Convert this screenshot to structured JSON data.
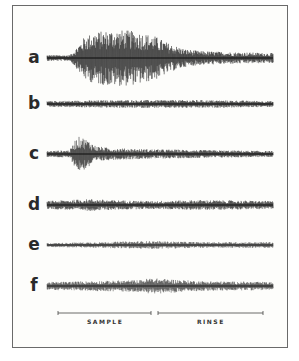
{
  "figure": {
    "rows": [
      {
        "label": "a",
        "center_y": 58,
        "envelope": [
          [
            47,
            3
          ],
          [
            70,
            3
          ],
          [
            76,
            10
          ],
          [
            85,
            22
          ],
          [
            95,
            26
          ],
          [
            110,
            28
          ],
          [
            125,
            28
          ],
          [
            140,
            26
          ],
          [
            155,
            22
          ],
          [
            170,
            14
          ],
          [
            185,
            9
          ],
          [
            200,
            7
          ],
          [
            230,
            6
          ],
          [
            273,
            5
          ]
        ],
        "ink": 0.95
      },
      {
        "label": "b",
        "center_y": 104,
        "envelope": [
          [
            47,
            3
          ],
          [
            120,
            4
          ],
          [
            200,
            4
          ],
          [
            273,
            3
          ]
        ],
        "ink": 0.9
      },
      {
        "label": "c",
        "center_y": 154,
        "envelope": [
          [
            47,
            3
          ],
          [
            70,
            4
          ],
          [
            75,
            14
          ],
          [
            80,
            18
          ],
          [
            88,
            14
          ],
          [
            96,
            8
          ],
          [
            110,
            6
          ],
          [
            140,
            5
          ],
          [
            200,
            4
          ],
          [
            273,
            3
          ]
        ],
        "ink": 0.9
      },
      {
        "label": "d",
        "center_y": 205,
        "envelope": [
          [
            47,
            4
          ],
          [
            90,
            6
          ],
          [
            110,
            5
          ],
          [
            150,
            4
          ],
          [
            200,
            5
          ],
          [
            273,
            4
          ]
        ],
        "ink": 0.9
      },
      {
        "label": "e",
        "center_y": 245,
        "envelope": [
          [
            47,
            2
          ],
          [
            100,
            3
          ],
          [
            150,
            4
          ],
          [
            200,
            3
          ],
          [
            273,
            3
          ]
        ],
        "ink": 0.7
      },
      {
        "label": "f",
        "center_y": 286,
        "envelope": [
          [
            47,
            4
          ],
          [
            140,
            6
          ],
          [
            150,
            8
          ],
          [
            200,
            5
          ],
          [
            273,
            4
          ]
        ],
        "ink": 0.75
      }
    ],
    "scale_bars": [
      {
        "label": "SAMPLE",
        "x1": 58,
        "x2": 151,
        "y": 313,
        "label_x": 87
      },
      {
        "label": "RINSE",
        "x1": 158,
        "x2": 263,
        "y": 313,
        "label_x": 197
      }
    ],
    "colors": {
      "ink": "#1a1a1a",
      "frame": "#6a6a6a",
      "paper": "#fdfdfb"
    }
  }
}
